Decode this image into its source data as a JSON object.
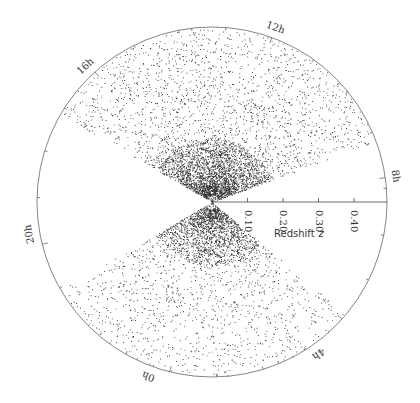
{
  "chart_data": {
    "type": "scatter",
    "subtype": "polar-wedge-redshift-cone",
    "title": "",
    "radial_axis": {
      "label": "Redshift",
      "label_symbol": "z",
      "ticks": [
        0.1,
        0.2,
        0.3,
        0.4
      ],
      "tick_labels": [
        "0.10",
        "0.20",
        "0.30",
        "0.40"
      ]
    },
    "angular_axis": {
      "unit": "hours (right ascension)",
      "labels": [
        "8h",
        "12h",
        "16h",
        "20h",
        "0h",
        "4h"
      ]
    },
    "series": [
      {
        "name": "northern wedge",
        "ra_range_label": [
          "8h",
          "16h"
        ]
      },
      {
        "name": "southern wedge",
        "ra_range_label": [
          "20h",
          "4h"
        ]
      }
    ],
    "grid": false,
    "legend": null
  },
  "colors": {
    "points": "#111111",
    "axis": "#555555",
    "background": "#ffffff"
  }
}
